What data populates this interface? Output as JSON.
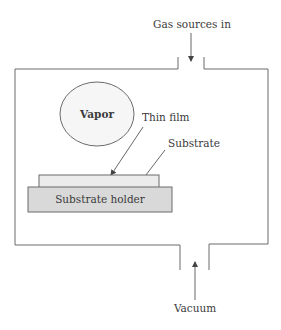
{
  "diagram": {
    "title": "",
    "labels": {
      "gas_in": "Gas sources in",
      "vapor": "Vapor",
      "thin_film": "Thin film",
      "substrate": "Substrate",
      "substrate_holder": "Substrate holder",
      "vacuum": "Vacuum"
    },
    "nodes": [
      {
        "id": "chamber",
        "type": "rectangle-with-ports",
        "label": ""
      },
      {
        "id": "gas-inlet",
        "type": "port",
        "label": "Gas sources in"
      },
      {
        "id": "vapor",
        "type": "ellipse",
        "label": "Vapor"
      },
      {
        "id": "thin-film",
        "type": "layer",
        "label": "Thin film"
      },
      {
        "id": "substrate",
        "type": "rectangle",
        "label": "Substrate"
      },
      {
        "id": "substrate-holder",
        "type": "rectangle",
        "label": "Substrate holder"
      },
      {
        "id": "vacuum-outlet",
        "type": "port",
        "label": "Vacuum"
      }
    ],
    "edges": [
      {
        "from": "gas-inlet-label",
        "to": "chamber",
        "direction": "down"
      },
      {
        "from": "vacuum-label",
        "to": "chamber",
        "direction": "up"
      },
      {
        "from": "thin-film-label",
        "to": "thin-film"
      },
      {
        "from": "substrate-label",
        "to": "substrate"
      }
    ],
    "colors": {
      "line": "#6b6b6b",
      "substrate_fill": "#ececec",
      "holder_fill": "#d9d9d9",
      "vapor_fill": "#f6f6f6",
      "text": "#3a3a3a"
    }
  }
}
